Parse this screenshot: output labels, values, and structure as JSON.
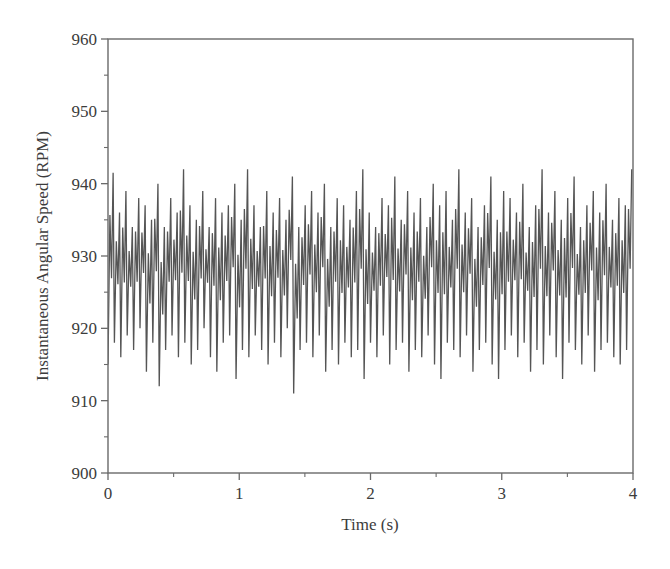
{
  "chart_data": {
    "type": "line",
    "title": "",
    "xlabel": "Time (s)",
    "ylabel": "Instantaneous Angular Speed (RPM)",
    "xlim": [
      0,
      4
    ],
    "ylim": [
      900,
      960
    ],
    "xticks": [
      0,
      1,
      2,
      3,
      4
    ],
    "xtick_labels": [
      "0",
      "1",
      "2",
      "3",
      "4"
    ],
    "xminor_ticks": [
      0.5,
      1.5,
      2.5,
      3.5
    ],
    "yticks": [
      900,
      910,
      920,
      930,
      940,
      950,
      960
    ],
    "ytick_labels": [
      "900",
      "910",
      "920",
      "930",
      "940",
      "950",
      "960"
    ],
    "yminor_ticks": [
      905,
      915,
      925,
      935,
      945,
      955
    ],
    "grid": false,
    "legend": null,
    "line_color": "#555555",
    "frame": "box",
    "series": [
      {
        "name": "Instantaneous Angular Speed",
        "sampling": "4 extrema per cycle, ~20.5 cycles/s, t from 0 to 4 s",
        "cycle_peaks": [
          941.5,
          936,
          939,
          934,
          938,
          937,
          935,
          940,
          934,
          938,
          936,
          942,
          937,
          935,
          939,
          934,
          938,
          936,
          937,
          940,
          935,
          942,
          937,
          934,
          939,
          936,
          938,
          935,
          941,
          934,
          937,
          939,
          936,
          940,
          934,
          938,
          937,
          935,
          939,
          942,
          936,
          934,
          938,
          937,
          941,
          935,
          939,
          936,
          938,
          934,
          940,
          937,
          939,
          935,
          942,
          936,
          938,
          934,
          937,
          941,
          935,
          939,
          938,
          936,
          940,
          934,
          937,
          942,
          936,
          939,
          935,
          938,
          941,
          934,
          937,
          939,
          936,
          940,
          935,
          938,
          937,
          942
        ],
        "cycle_troughs": [
          915,
          918,
          916,
          919,
          917,
          920,
          914,
          918,
          912,
          917,
          919,
          916,
          918,
          915,
          917,
          920,
          916,
          914,
          918,
          919,
          913,
          917,
          916,
          919,
          917,
          915,
          918,
          916,
          920,
          911,
          917,
          918,
          916,
          919,
          914,
          917,
          915,
          918,
          916,
          917,
          913,
          918,
          916,
          919,
          915,
          917,
          918,
          914,
          917,
          916,
          919,
          915,
          913,
          918,
          917,
          916,
          919,
          914,
          917,
          918,
          915,
          913,
          917,
          919,
          916,
          918,
          914,
          917,
          915,
          919,
          916,
          913,
          918,
          917,
          915,
          919,
          914,
          917,
          918,
          916,
          915,
          917
        ]
      }
    ]
  }
}
